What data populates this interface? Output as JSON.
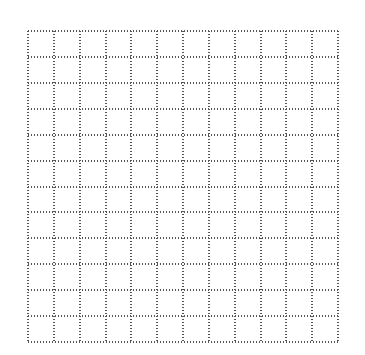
{
  "grid": {
    "rows": 12,
    "cols": 12,
    "left": 27,
    "top": 30,
    "width": 312,
    "height": 313,
    "line_style": "dotted",
    "dot_color": "#555555",
    "background": "#ffffff"
  }
}
